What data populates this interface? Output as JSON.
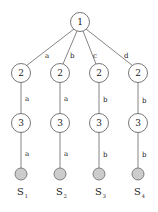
{
  "diagram": {
    "type": "tree",
    "colors": {
      "line": "#666666",
      "node_fill": "#ffffff",
      "node_stroke": "#555555",
      "leaf_fill": "#cccccc",
      "leaf_stroke": "#666666",
      "text": "#222222"
    },
    "root": {
      "label": "1",
      "x": 80,
      "y": 22
    },
    "level2": [
      {
        "label": "2",
        "x": 21,
        "y": 73,
        "edge_label": "a"
      },
      {
        "label": "2",
        "x": 60,
        "y": 73,
        "edge_label": "b"
      },
      {
        "label": "2",
        "x": 99,
        "y": 73,
        "edge_label": "c"
      },
      {
        "label": "2",
        "x": 138,
        "y": 73,
        "edge_label": "d"
      }
    ],
    "level3": [
      {
        "label": "3",
        "x": 21,
        "y": 123,
        "edge_label": "a"
      },
      {
        "label": "3",
        "x": 60,
        "y": 123,
        "edge_label": "a"
      },
      {
        "label": "3",
        "x": 99,
        "y": 123,
        "edge_label": "b"
      },
      {
        "label": "3",
        "x": 138,
        "y": 123,
        "edge_label": "b"
      }
    ],
    "leaves": [
      {
        "x": 21,
        "y": 174,
        "edge_label": "a",
        "name": "S",
        "sub": "1"
      },
      {
        "x": 60,
        "y": 174,
        "edge_label": "a",
        "name": "S",
        "sub": "2"
      },
      {
        "x": 99,
        "y": 174,
        "edge_label": "b",
        "name": "S",
        "sub": "3"
      },
      {
        "x": 138,
        "y": 174,
        "edge_label": "b",
        "name": "S",
        "sub": "4"
      }
    ]
  }
}
